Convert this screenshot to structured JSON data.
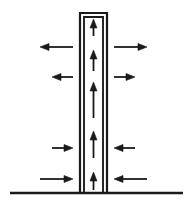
{
  "figure": {
    "background_color": "#ffffff",
    "ink_color": "#1a1a1a",
    "width": 191,
    "height": 208
  },
  "ground": {
    "label": "ground-line",
    "x1": 10,
    "x2": 183,
    "y": 193,
    "stroke_width": 2.4,
    "color": "#1a1a1a"
  },
  "stack": {
    "label": "chimney-stack",
    "outer_left": 80,
    "outer_right": 107,
    "top": 13,
    "bottom": 193,
    "wall_thickness": 2.2,
    "inner_left": 84,
    "inner_right": 103,
    "color": "#1a1a1a",
    "fill": "#ffffff"
  },
  "inner_arrows": {
    "label": "updraft-arrows",
    "direction": "up",
    "color": "#1a1a1a",
    "stroke_width": 1.8,
    "head_width": 7,
    "head_length": 9,
    "x": 93.5,
    "items": [
      {
        "name": "updraft-arrow-1",
        "y_tail": 36,
        "y_head": 19,
        "length": 17
      },
      {
        "name": "updraft-arrow-2",
        "y_tail": 71,
        "y_head": 50,
        "length": 21
      },
      {
        "name": "updraft-arrow-3",
        "y_tail": 118,
        "y_head": 82,
        "length": 36
      },
      {
        "name": "updraft-arrow-4",
        "y_tail": 158,
        "y_head": 131,
        "length": 27
      },
      {
        "name": "updraft-arrow-5",
        "y_tail": 190,
        "y_head": 172,
        "length": 18
      }
    ]
  },
  "outer_arrows": {
    "label": "ambient-flow-arrows",
    "color": "#1a1a1a",
    "stroke_width": 1.8,
    "head_width": 7,
    "head_length": 9,
    "items": [
      {
        "name": "left-upper-outflow-arrow",
        "side": "left",
        "direction": "left",
        "y": 47,
        "x_tail": 73,
        "x_head": 40,
        "length": 33
      },
      {
        "name": "left-mid-outflow-arrow",
        "side": "left",
        "direction": "left",
        "y": 77,
        "x_tail": 73,
        "x_head": 52,
        "length": 21
      },
      {
        "name": "left-lower-inflow-arrow",
        "side": "left",
        "direction": "right",
        "y": 148,
        "x_tail": 52,
        "x_head": 73,
        "length": 21
      },
      {
        "name": "left-bottom-inflow-arrow",
        "side": "left",
        "direction": "right",
        "y": 179,
        "x_tail": 40,
        "x_head": 73,
        "length": 33
      },
      {
        "name": "right-upper-outflow-arrow",
        "side": "right",
        "direction": "right",
        "y": 47,
        "x_tail": 114,
        "x_head": 147,
        "length": 33
      },
      {
        "name": "right-mid-outflow-arrow",
        "side": "right",
        "direction": "right",
        "y": 77,
        "x_tail": 114,
        "x_head": 135,
        "length": 21
      },
      {
        "name": "right-lower-inflow-arrow",
        "side": "right",
        "direction": "left",
        "y": 148,
        "x_tail": 135,
        "x_head": 114,
        "length": 21
      },
      {
        "name": "right-bottom-inflow-arrow",
        "side": "right",
        "direction": "left",
        "y": 179,
        "x_tail": 147,
        "x_head": 114,
        "length": 33
      }
    ]
  }
}
